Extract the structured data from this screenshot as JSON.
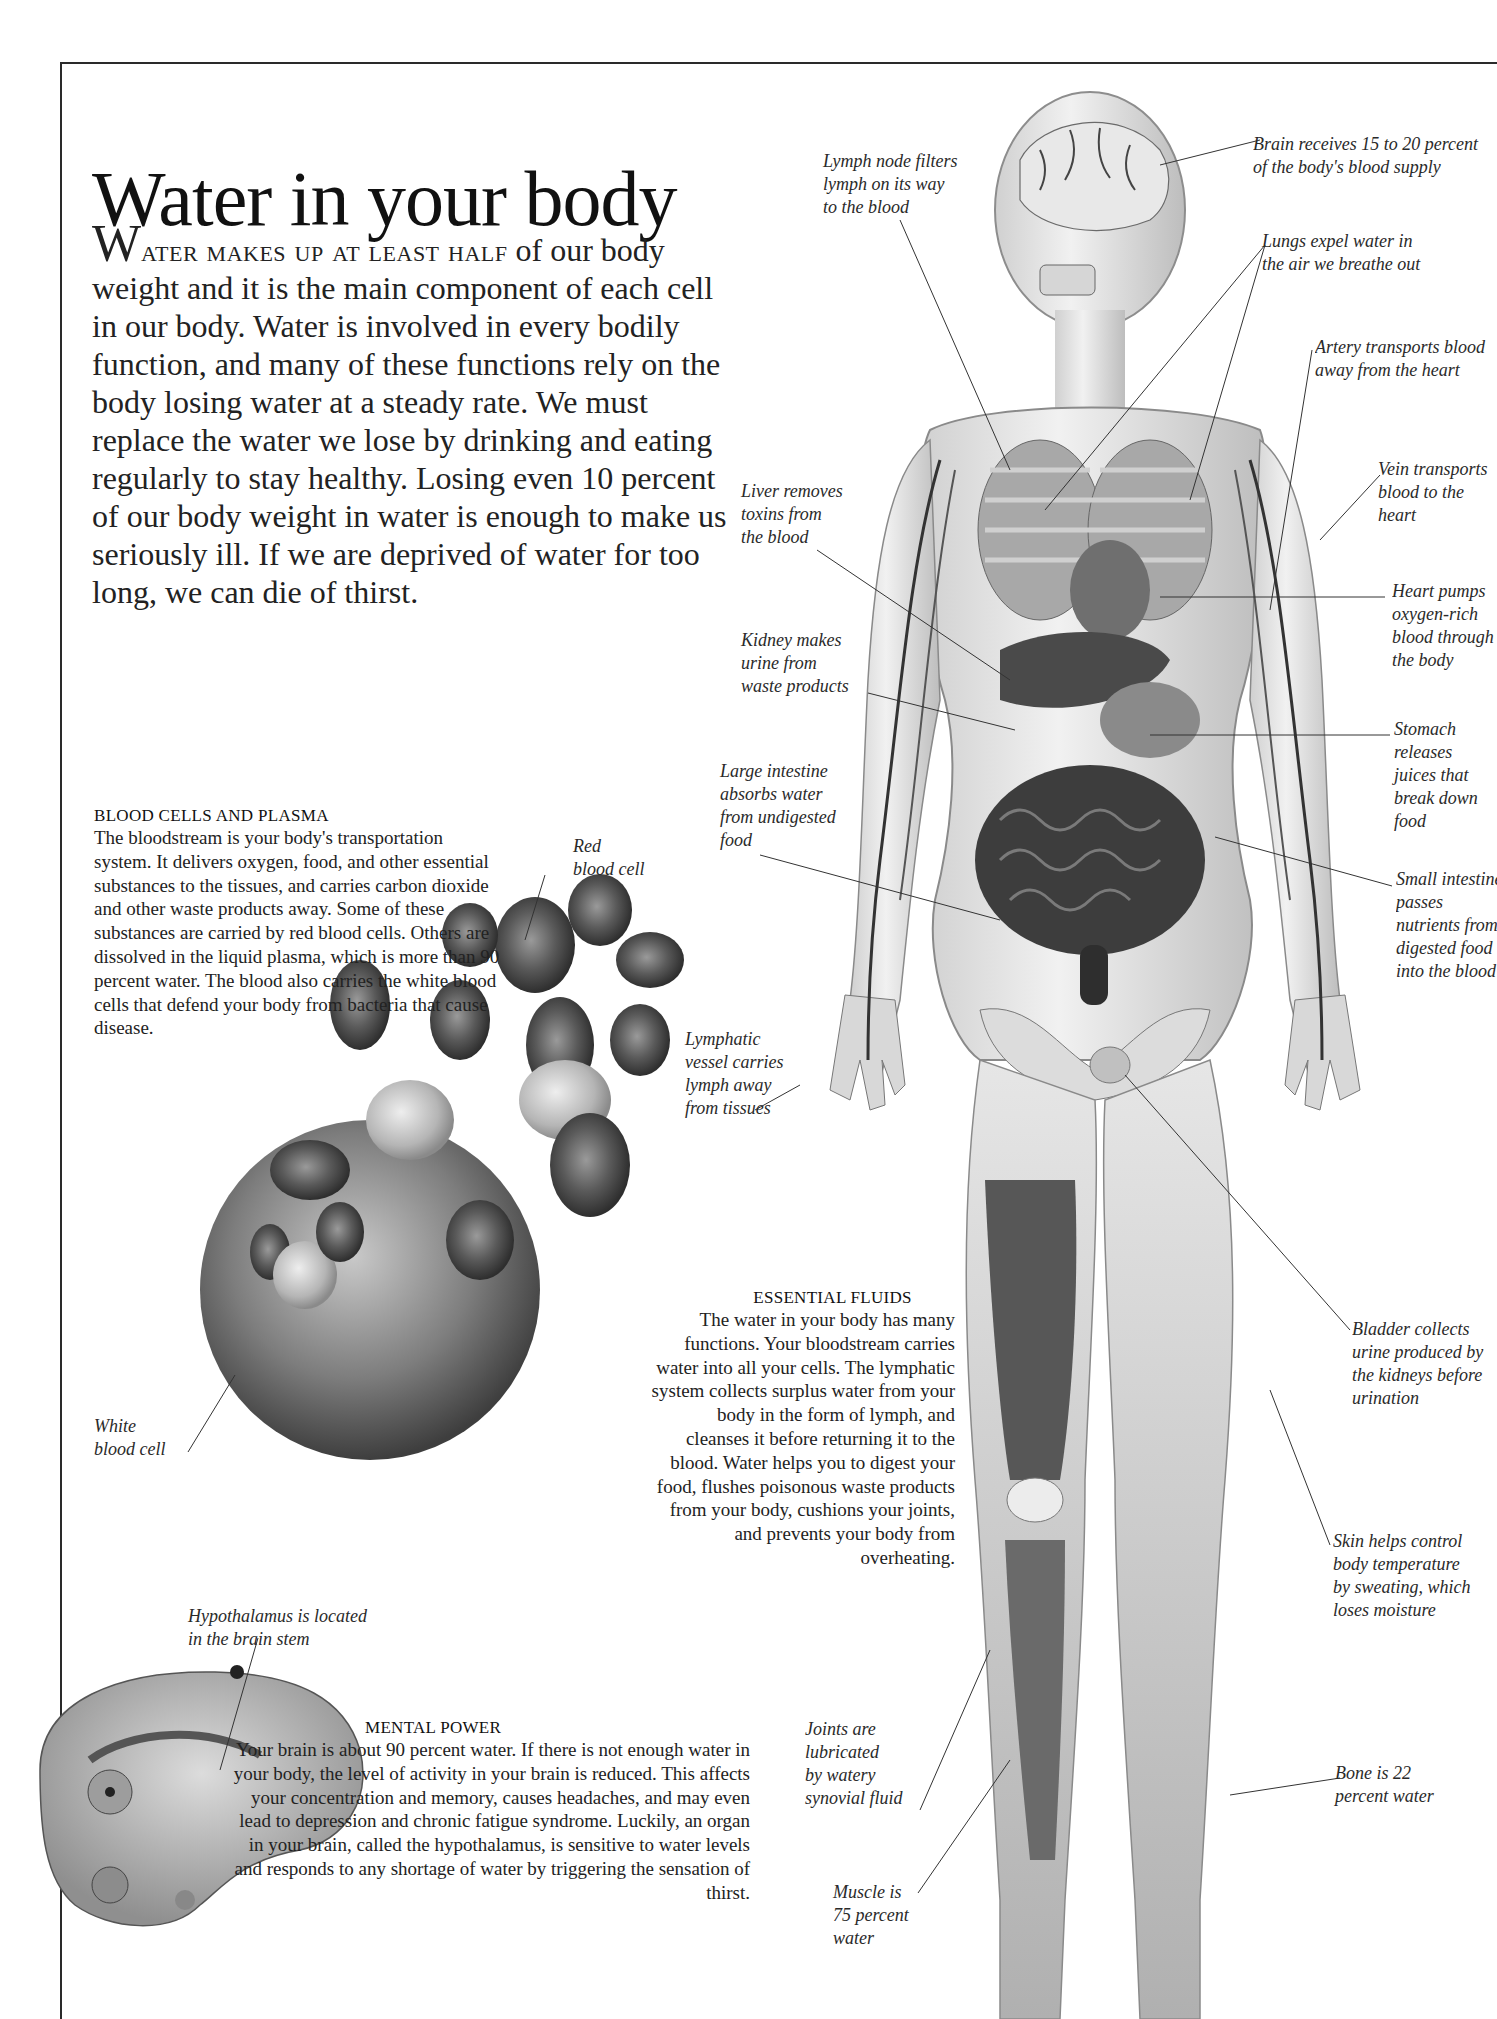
{
  "page": {
    "title": "Water in your body",
    "intro": {
      "dropcap": "W",
      "smallcaps": "ater makes up at least half",
      "text": " of our body weight and it is the main component of each cell in our body. Water is involved in every bodily function, and many of these functions rely on the body losing water at a steady rate. We must replace the water we lose by drinking and eating regularly to stay healthy. Losing even 10 percent of our body weight in water is enough to make us seriously ill. If we are deprived of water for too long, we can die of thirst."
    }
  },
  "sections": {
    "blood": {
      "heading": "BLOOD CELLS AND PLASMA",
      "body": "The bloodstream is your body's transportation system. It delivers oxygen, food, and other essential substances to the tissues, and carries carbon dioxide and other waste products away. Some of these substances are carried by red blood cells. Others are dissolved in the liquid plasma, which is more than 90 percent water. The blood also carries the white blood cells that defend your body from bacteria that cause disease."
    },
    "fluids": {
      "heading": "ESSENTIAL FLUIDS",
      "body": "The water in your body has many functions. Your bloodstream carries water into all your cells. The lymphatic system collects surplus water from your body in the form of lymph, and cleanses it before returning it to the blood. Water helps you to digest your food, flushes poisonous waste products from your body, cushions your joints, and prevents your body from overheating."
    },
    "mental": {
      "heading": "MENTAL POWER",
      "body": "Your brain is about 90 percent water. If there is not enough water in your body, the level of activity in your brain is reduced. This affects your concentration and memory, causes headaches, and may even lead to depression and chronic fatigue syndrome. Luckily, an organ in your brain, called the hypothalamus, is sensitive to water levels and responds to any shortage of water by triggering the sensation of thirst."
    }
  },
  "callouts": {
    "red_blood_cell": "Red\nblood cell",
    "white_blood_cell": "White\nblood cell",
    "hypothalamus": "Hypothalamus is located\nin the brain stem",
    "lymph_node": "Lymph node filters\nlymph on its way\nto the blood",
    "brain_blood": "Brain receives 15 to 20 percent\nof the body's blood supply",
    "lungs": "Lungs expel water in\nthe air we breathe out",
    "artery": "Artery transports blood\naway from the heart",
    "vein": "Vein transports\nblood to the\nheart",
    "heart": "Heart pumps\noxygen-rich\nblood through\nthe body",
    "liver": "Liver removes\ntoxins from\nthe blood",
    "kidney": "Kidney makes\nurine from\nwaste products",
    "stomach": "Stomach\nreleases\njuices that\nbreak down\nfood",
    "large_intestine": "Large intestine\nabsorbs water\nfrom undigested\nfood",
    "small_intestine": "Small intestine\npasses\nnutrients from\ndigested food\ninto the blood",
    "lymphatic_vessel": "Lymphatic\nvessel carries\nlymph away\nfrom tissues",
    "bladder": "Bladder collects\nurine produced by\nthe kidneys before\nurination",
    "skin": "Skin helps control\nbody temperature\nby sweating, which\nloses moisture",
    "joints": "Joints are\nlubricated\nby watery\nsynovial fluid",
    "bone": "Bone is 22\npercent water",
    "muscle": "Muscle is\n75 percent\nwater"
  }
}
